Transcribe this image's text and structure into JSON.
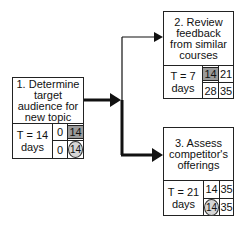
{
  "tasks": [
    {
      "id": 1,
      "title": "1. Determine target audience for new topic",
      "duration_label": "T = 14",
      "duration_unit": "days",
      "early_start": "0",
      "early_finish": "14",
      "late_start": "0",
      "late_finish": "14",
      "early_finish_style": "shaded",
      "late_finish_style": "circled"
    },
    {
      "id": 2,
      "title": "2. Review feedback from similar courses",
      "duration_label": "T = 7",
      "duration_unit": "days",
      "early_start": "14",
      "early_finish": "21",
      "late_start": "28",
      "late_finish": "35",
      "early_start_style": "shaded"
    },
    {
      "id": 3,
      "title": "3. Assess competitor's offerings",
      "duration_label": "T = 21",
      "duration_unit": "days",
      "early_start": "14",
      "early_finish": "35",
      "late_start": "14",
      "late_finish": "35",
      "late_start_style": "circled"
    }
  ],
  "connections": [
    {
      "from": 1,
      "to": 2,
      "weight": "thin"
    },
    {
      "from": 1,
      "to": 3,
      "weight": "thick (critical path)"
    }
  ]
}
